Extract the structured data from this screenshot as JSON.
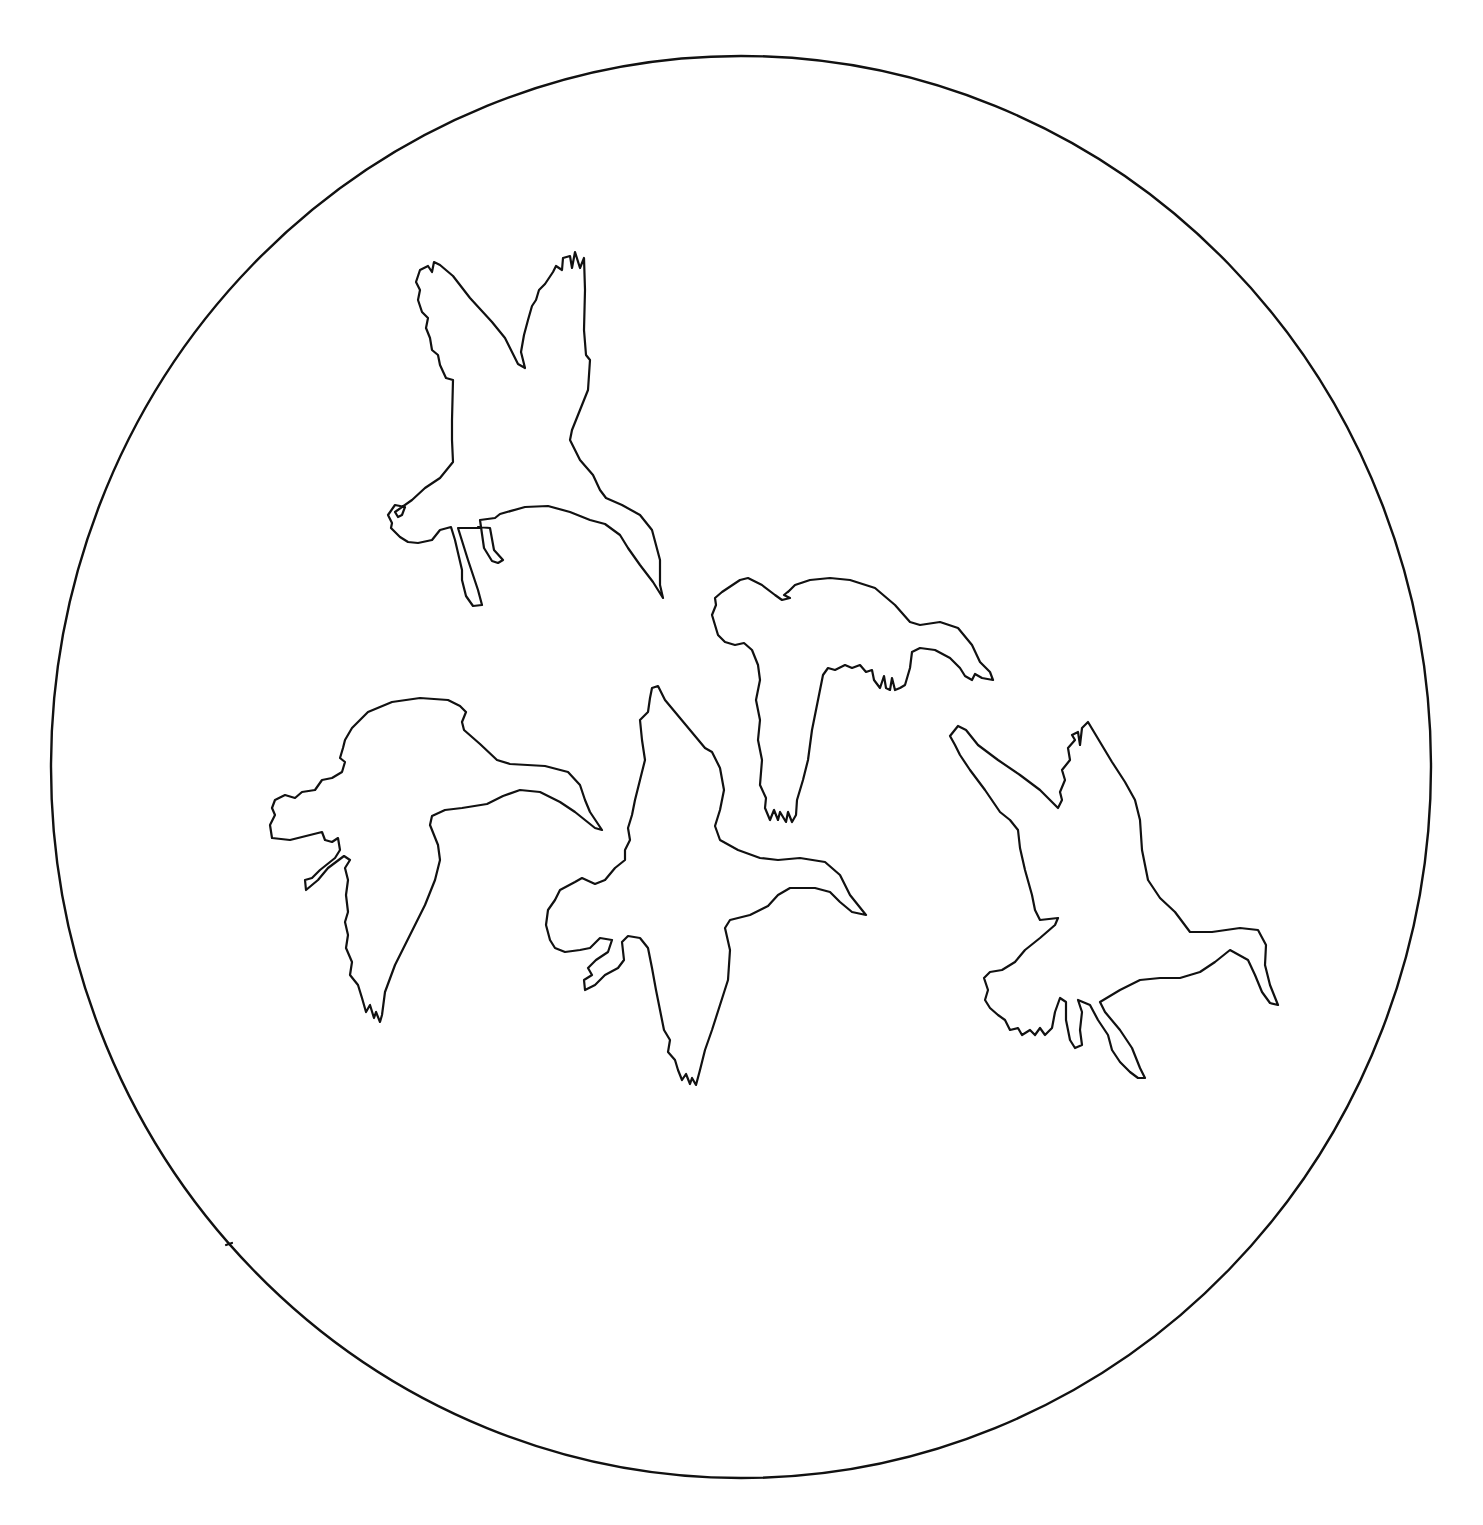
{
  "artwork": {
    "title": "Flock of ducks in flight",
    "style": "black line-art outlines on white",
    "colors": {
      "ink": "#111111",
      "background": "#ffffff"
    },
    "frame": {
      "shape": "circle",
      "center": [
        741,
        767
      ],
      "radius_x": 690,
      "radius_y": 711
    },
    "figures": [
      {
        "id": "duck-1",
        "description": "duck with wings raised, diving head down-right",
        "position": "upper center-left"
      },
      {
        "id": "duck-2",
        "description": "duck in level flight, head right",
        "position": "center-right"
      },
      {
        "id": "duck-3",
        "description": "duck gliding, head right",
        "position": "left"
      },
      {
        "id": "duck-4",
        "description": "duck with wings spread, head right",
        "position": "center"
      },
      {
        "id": "duck-5",
        "description": "duck with wings raised, landing, head down-right",
        "position": "right"
      }
    ]
  }
}
